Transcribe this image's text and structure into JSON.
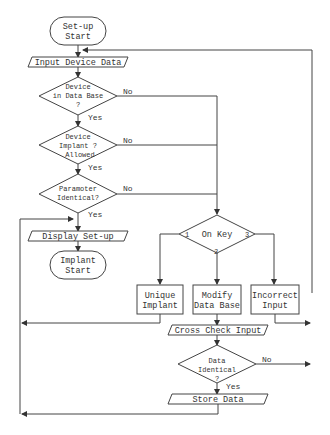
{
  "diagram": {
    "type": "flowchart",
    "nodes": {
      "setup_start": {
        "line1": "Set-up",
        "line2": "Start"
      },
      "input_device_data": {
        "label": "Input Device Data"
      },
      "device_in_db": {
        "line1": "Device",
        "line2": "in Data Base",
        "line3": "?"
      },
      "device_implant_allowed": {
        "line1": "Device",
        "line2": "Implant  ?",
        "line3": "Allowed"
      },
      "parameter_identical": {
        "line1": "Paramoter",
        "line2": "Identical?"
      },
      "display_setup": {
        "label": "Display Set-up"
      },
      "implant_start": {
        "line1": "Implant",
        "line2": "Start"
      },
      "on_key": {
        "label": "On Key",
        "opt1": "1",
        "opt2": "2",
        "opt3": "3"
      },
      "unique_implant": {
        "line1": "Unique",
        "line2": "Implant"
      },
      "modify_db": {
        "line1": "Modify",
        "line2": "Data Base"
      },
      "incorrect_input": {
        "line1": "Incorrect",
        "line2": "Input"
      },
      "cross_check_input": {
        "label": "Cross Check Input"
      },
      "data_identical": {
        "line1": "Data",
        "line2": "Identical",
        "line3": "?"
      },
      "store_data": {
        "label": "Store Data"
      }
    },
    "edge_labels": {
      "yes": "Yes",
      "no": "No"
    }
  }
}
